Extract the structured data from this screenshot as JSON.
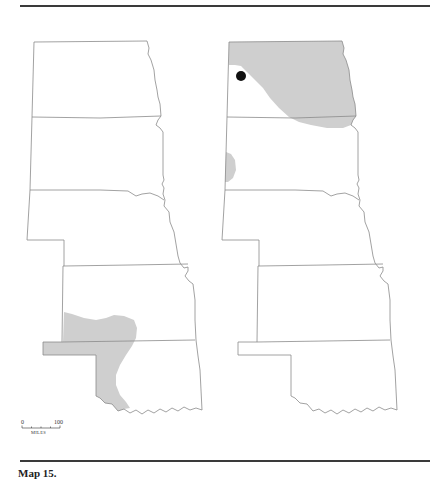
{
  "figure": {
    "caption_label": "Map 15.",
    "caption_text": "",
    "background": "#ffffff",
    "range_fill_color": "#cfcfcf",
    "outline_color": "#8a8a8a",
    "record_marker_color": "#111111"
  },
  "scale_bar": {
    "min_label": "0",
    "max_label": "100",
    "unit_label": "MILES"
  },
  "maps": [
    {
      "id": "left",
      "states": [
        "North Dakota",
        "South Dakota",
        "Nebraska",
        "Kansas",
        "Oklahoma"
      ],
      "shaded_region": "southwest Kansas, Oklahoma panhandle, western Oklahoma"
    },
    {
      "id": "right",
      "states": [
        "North Dakota",
        "South Dakota",
        "Nebraska",
        "Kansas",
        "Oklahoma"
      ],
      "shaded_region": "northern and eastern North Dakota, northeast South Dakota corner, western South Dakota edge",
      "point_records": 1
    }
  ]
}
